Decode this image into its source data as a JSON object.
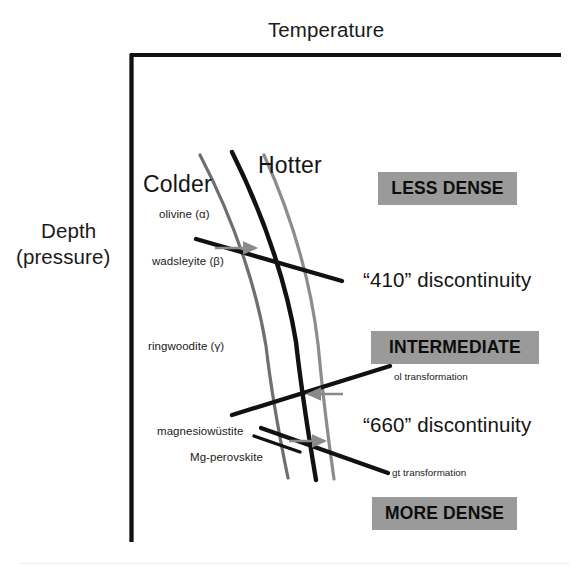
{
  "figure": {
    "type": "phase-diagram",
    "background_color": "#ffffff",
    "width": 583,
    "height": 574
  },
  "axes": {
    "x_axis_label": "Temperature",
    "y_axis_label_line1": "Depth",
    "y_axis_label_line2": "(pressure)",
    "axis_color": "#111111",
    "corner_x": 130,
    "corner_y": 54,
    "x_axis_end_x": 561,
    "y_axis_end_y": 542
  },
  "geotherms": {
    "colder_label": "Colder",
    "hotter_label": "Hotter",
    "cold_curve_color": "#6f6f6f",
    "average_curve_color": "#111111",
    "hot_curve_color": "#8c8c8c"
  },
  "minerals": [
    {
      "name": "olivine (α)",
      "symbol": "α"
    },
    {
      "name": "wadsleyite (β)",
      "symbol": "β"
    },
    {
      "name": "ringwoodite (γ)",
      "symbol": "γ"
    },
    {
      "name": "magnesiowüstite",
      "symbol": ""
    },
    {
      "name": "Mg-perovskite",
      "symbol": ""
    }
  ],
  "transformations": [
    {
      "name": "ol transformation",
      "arrow_direction": "left",
      "arrow_color": "#8a8a8a"
    },
    {
      "name": "gt transformation",
      "arrow_direction": "right",
      "arrow_color": "#8a8a8a"
    }
  ],
  "discontinuities": [
    {
      "label": "“410” discontinuity",
      "depth_km": 410
    },
    {
      "label": "“660” discontinuity",
      "depth_km": 660
    }
  ],
  "density_bands": [
    {
      "label": "LESS DENSE",
      "background": "#9a9a9a"
    },
    {
      "label": "INTERMEDIATE",
      "background": "#9a9a9a"
    },
    {
      "label": "MORE DENSE",
      "background": "#9a9a9a"
    }
  ]
}
